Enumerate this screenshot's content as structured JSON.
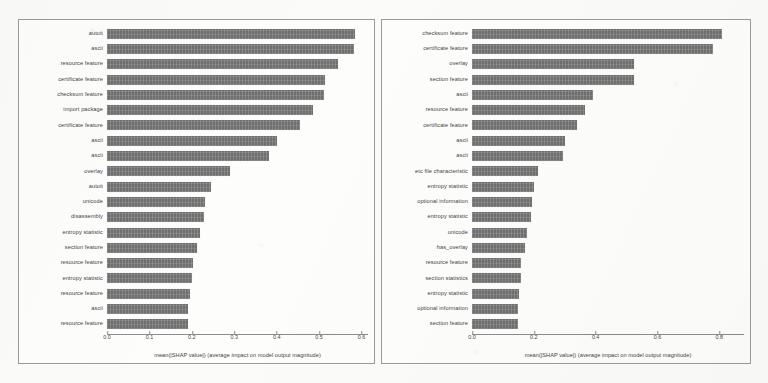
{
  "figure": {
    "background_color": "#fbfbf9",
    "bar_color": "#6f6f6f",
    "frame_color": "#9a9a9a"
  },
  "chart_data": [
    {
      "type": "bar",
      "orientation": "horizontal",
      "panel": "left",
      "title": "",
      "xlabel": "mean(|SHAP value|) (average impact on model output magnitude)",
      "ylabel": "",
      "xlim": [
        0.0,
        0.62
      ],
      "xticks": [
        0.0,
        0.1,
        0.2,
        0.3,
        0.4,
        0.5,
        0.6
      ],
      "xticklabels": [
        "0.0",
        "0.1",
        "0.2",
        "0.3",
        "0.4",
        "0.5",
        "0.6"
      ],
      "grid": false,
      "legend": null,
      "categories": [
        "autoit",
        "ascii",
        "resource feature",
        "certificate feature",
        "checksum feature",
        "import package",
        "certificate feature",
        "ascii",
        "ascii",
        "overlay",
        "autoit",
        "unicode",
        "disassembly",
        "entropy statistic",
        "section feature",
        "resource feature",
        "entropy statistic",
        "resource feature",
        "ascii",
        "resource feature"
      ],
      "values": [
        0.585,
        0.583,
        0.545,
        0.515,
        0.512,
        0.485,
        0.455,
        0.4,
        0.382,
        0.29,
        0.245,
        0.232,
        0.228,
        0.22,
        0.212,
        0.202,
        0.2,
        0.196,
        0.192,
        0.19
      ]
    },
    {
      "type": "bar",
      "orientation": "horizontal",
      "panel": "right",
      "title": "",
      "xlabel": "mean(|SHAP value|) (average impact on model output magnitude)",
      "ylabel": "",
      "xlim": [
        0.0,
        0.88
      ],
      "xticks": [
        0.0,
        0.2,
        0.4,
        0.6,
        0.8
      ],
      "xticklabels": [
        "0.0",
        "0.2",
        "0.4",
        "0.6",
        "0.8"
      ],
      "grid": false,
      "legend": null,
      "categories": [
        "checksum feature",
        "certificate feature",
        "overlay",
        "section feature",
        "ascii",
        "resource feature",
        "certificate feature",
        "ascii",
        "ascii",
        "etc file characteristic",
        "entropy statistic",
        "optional information",
        "entropy statistic",
        "unicode",
        "has_overlay",
        "resource feature",
        "section statistics",
        "entropy statistic",
        "optional information",
        "section feature"
      ],
      "values": [
        0.81,
        0.78,
        0.525,
        0.525,
        0.39,
        0.365,
        0.34,
        0.3,
        0.295,
        0.215,
        0.2,
        0.195,
        0.19,
        0.178,
        0.172,
        0.16,
        0.158,
        0.152,
        0.15,
        0.15
      ]
    }
  ]
}
